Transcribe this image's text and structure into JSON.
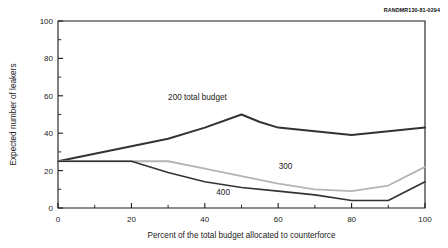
{
  "figure": {
    "publication_id": "RANDMR130-81-0294"
  },
  "chart_data": {
    "type": "line",
    "title": "",
    "xlabel": "Percent of the total budget allocated to counterforce",
    "ylabel": "Expected number of leakers",
    "xlim": [
      0,
      100
    ],
    "ylim": [
      0,
      100
    ],
    "xticks": [
      0,
      20,
      40,
      60,
      80,
      100
    ],
    "xtick_labels": [
      "0",
      "20",
      "40",
      "60",
      "80",
      "100"
    ],
    "yticks": [
      0,
      20,
      40,
      60,
      80,
      100
    ],
    "ytick_labels": [
      "0",
      "20",
      "40",
      "60",
      "80",
      "100"
    ],
    "x_minor_step": 10,
    "y_minor_step": 10,
    "grid": false,
    "legend_position": "inline-annotations",
    "series": [
      {
        "name": "200 total budget",
        "label": "200 total budget",
        "color": "#333333",
        "width": 2.0,
        "x": [
          0,
          10,
          20,
          30,
          40,
          50,
          55,
          60,
          70,
          80,
          90,
          100
        ],
        "values": [
          25,
          29,
          33,
          37,
          43,
          50,
          46,
          43,
          41,
          39,
          41,
          43
        ]
      },
      {
        "name": "300",
        "label": "300",
        "color": "#b4b4b4",
        "width": 1.8,
        "x": [
          0,
          10,
          20,
          30,
          40,
          50,
          60,
          70,
          80,
          90,
          100
        ],
        "values": [
          25,
          25,
          25,
          25,
          21,
          17,
          13,
          10,
          9,
          12,
          22
        ]
      },
      {
        "name": "400",
        "label": "400",
        "color": "#333333",
        "width": 1.6,
        "x": [
          0,
          10,
          20,
          30,
          40,
          50,
          60,
          70,
          80,
          90,
          100
        ],
        "values": [
          25,
          25,
          25,
          19,
          14,
          11,
          9,
          7,
          4,
          4,
          14
        ]
      }
    ],
    "annotations": [
      {
        "text": "200 total budget",
        "x": 38,
        "y": 58,
        "series": "200 total budget"
      },
      {
        "text": "300",
        "x": 62,
        "y": 21,
        "series": "300"
      },
      {
        "text": "400",
        "x": 45,
        "y": 7,
        "series": "400"
      }
    ]
  }
}
